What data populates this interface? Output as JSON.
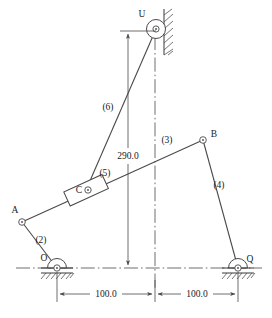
{
  "diagram": {
    "stroke_color": "#4a4a4a",
    "text_color": "#1a1a1a",
    "background": "#ffffff",
    "joints": [
      {
        "id": "U",
        "label": "U",
        "x": 156,
        "y": 29,
        "type": "wall-pivot"
      },
      {
        "id": "B",
        "label": "B",
        "x": 203,
        "y": 140,
        "type": "pin"
      },
      {
        "id": "C",
        "label": "C",
        "x": 86,
        "y": 190,
        "type": "slider-pin"
      },
      {
        "id": "A",
        "label": "A",
        "x": 22,
        "y": 222,
        "type": "pin"
      },
      {
        "id": "O",
        "label": "O",
        "x": 57,
        "y": 268,
        "type": "ground-pivot"
      },
      {
        "id": "Q",
        "label": "Q",
        "x": 238,
        "y": 268,
        "type": "ground-pivot"
      }
    ],
    "links": [
      {
        "id": "2",
        "label": "(2)",
        "from": "O",
        "to": "A",
        "label_x": 41,
        "label_y": 243
      },
      {
        "id": "3",
        "label": "(3)",
        "from": "A",
        "to": "B",
        "label_x": 167,
        "label_y": 143
      },
      {
        "id": "4",
        "label": "(4)",
        "from": "B",
        "to": "Q",
        "label_x": 219,
        "label_y": 188
      },
      {
        "id": "5",
        "label": "(5)",
        "from": "C",
        "to": "C",
        "label_x": 105,
        "label_y": 176
      },
      {
        "id": "6",
        "label": "(6)",
        "from": "C",
        "to": "U",
        "label_x": 108,
        "label_y": 110
      }
    ],
    "dimensions": [
      {
        "id": "vertical-290",
        "label": "290.0",
        "label_x": 128,
        "label_y": 156,
        "orientation": "vertical"
      },
      {
        "id": "horizontal-left",
        "label": "100.0",
        "label_x": 106,
        "label_y": 296,
        "orientation": "horizontal"
      },
      {
        "id": "horizontal-right",
        "label": "100.0",
        "label_x": 197,
        "label_y": 296,
        "orientation": "horizontal"
      }
    ]
  }
}
